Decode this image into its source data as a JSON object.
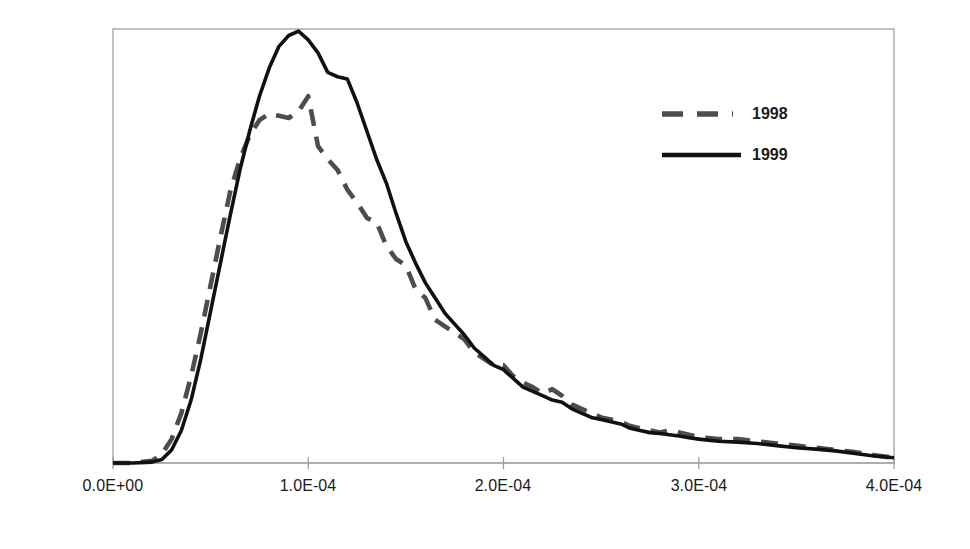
{
  "chart_data": {
    "type": "line",
    "title": "",
    "xlabel": "",
    "ylabel": "Likelihood",
    "xlim": [
      0.0,
      0.0004
    ],
    "ylim": [
      0,
      1.0
    ],
    "grid": false,
    "legend_position": "upper-right",
    "xticks": [
      "0.0E+00",
      "1.0E-04",
      "2.0E-04",
      "3.0E-04",
      "4.0E-04"
    ],
    "xtick_values": [
      0.0,
      0.0001,
      0.0002,
      0.0003,
      0.0004
    ],
    "yticks": [],
    "series": [
      {
        "name": "1998",
        "color": "#4d4d4d",
        "style": "dashed",
        "x": [
          0.0,
          1e-05,
          2e-05,
          2.5e-05,
          3e-05,
          3.5e-05,
          4e-05,
          4.5e-05,
          5e-05,
          5.5e-05,
          6e-05,
          6.5e-05,
          7e-05,
          7.5e-05,
          8e-05,
          8.5e-05,
          9e-05,
          9.5e-05,
          0.0001,
          0.000105,
          0.00011,
          0.000115,
          0.00012,
          0.000125,
          0.00013,
          0.000135,
          0.00014,
          0.000145,
          0.00015,
          0.000155,
          0.00016,
          0.000165,
          0.00017,
          0.000175,
          0.00018,
          0.000185,
          0.00019,
          0.000195,
          0.0002,
          0.000205,
          0.00021,
          0.000215,
          0.00022,
          0.000225,
          0.00023,
          0.000235,
          0.00024,
          0.000245,
          0.00025,
          0.000255,
          0.00026,
          0.000265,
          0.00027,
          0.000275,
          0.00028,
          0.000285,
          0.00029,
          0.000295,
          0.0003,
          0.00031,
          0.00032,
          0.00033,
          0.00034,
          0.00035,
          0.00036,
          0.00037,
          0.00038,
          0.00039,
          0.0004
        ],
        "y": [
          0.0,
          0.0,
          0.005,
          0.02,
          0.055,
          0.115,
          0.2,
          0.3,
          0.41,
          0.52,
          0.625,
          0.7,
          0.755,
          0.79,
          0.805,
          0.8,
          0.795,
          0.81,
          0.845,
          0.73,
          0.7,
          0.675,
          0.63,
          0.6,
          0.565,
          0.555,
          0.5,
          0.47,
          0.455,
          0.4,
          0.38,
          0.33,
          0.315,
          0.3,
          0.285,
          0.255,
          0.24,
          0.225,
          0.225,
          0.2,
          0.185,
          0.175,
          0.16,
          0.17,
          0.155,
          0.135,
          0.125,
          0.115,
          0.105,
          0.1,
          0.095,
          0.085,
          0.08,
          0.075,
          0.07,
          0.075,
          0.07,
          0.065,
          0.06,
          0.055,
          0.055,
          0.05,
          0.045,
          0.04,
          0.035,
          0.03,
          0.025,
          0.018,
          0.012
        ]
      },
      {
        "name": "1999",
        "color": "#111111",
        "style": "solid",
        "x": [
          0.0,
          1e-05,
          2e-05,
          2.5e-05,
          3e-05,
          3.5e-05,
          4e-05,
          4.5e-05,
          5e-05,
          5.5e-05,
          6e-05,
          6.5e-05,
          7e-05,
          7.5e-05,
          8e-05,
          8.5e-05,
          9e-05,
          9.5e-05,
          0.0001,
          0.000105,
          0.00011,
          0.000115,
          0.00012,
          0.000125,
          0.00013,
          0.000135,
          0.00014,
          0.000145,
          0.00015,
          0.000155,
          0.00016,
          0.000165,
          0.00017,
          0.000175,
          0.00018,
          0.000185,
          0.00019,
          0.000195,
          0.0002,
          0.000205,
          0.00021,
          0.000215,
          0.00022,
          0.000225,
          0.00023,
          0.000235,
          0.00024,
          0.000245,
          0.00025,
          0.000255,
          0.00026,
          0.000265,
          0.00027,
          0.000275,
          0.00028,
          0.000285,
          0.00029,
          0.000295,
          0.0003,
          0.00031,
          0.00032,
          0.00033,
          0.00034,
          0.00035,
          0.00036,
          0.00037,
          0.00038,
          0.00039,
          0.0004
        ],
        "y": [
          0.0,
          0.0,
          0.002,
          0.008,
          0.03,
          0.075,
          0.145,
          0.24,
          0.35,
          0.46,
          0.57,
          0.675,
          0.765,
          0.845,
          0.91,
          0.96,
          0.985,
          0.995,
          0.975,
          0.945,
          0.9,
          0.89,
          0.885,
          0.83,
          0.765,
          0.7,
          0.645,
          0.575,
          0.51,
          0.46,
          0.415,
          0.38,
          0.345,
          0.32,
          0.295,
          0.265,
          0.245,
          0.225,
          0.215,
          0.195,
          0.175,
          0.165,
          0.155,
          0.145,
          0.14,
          0.125,
          0.115,
          0.105,
          0.1,
          0.095,
          0.09,
          0.08,
          0.075,
          0.07,
          0.068,
          0.065,
          0.062,
          0.058,
          0.055,
          0.05,
          0.048,
          0.045,
          0.04,
          0.035,
          0.032,
          0.028,
          0.022,
          0.016,
          0.012
        ]
      }
    ]
  },
  "legend": {
    "items": [
      {
        "label": "1998"
      },
      {
        "label": "1999"
      }
    ]
  },
  "axes": {
    "ylabel": "Likelihood",
    "xtick_labels": [
      "0.0E+00",
      "1.0E-04",
      "2.0E-04",
      "3.0E-04",
      "4.0E-04"
    ]
  },
  "colors": {
    "series_1998": "#4d4d4d",
    "series_1999": "#111111",
    "axis": "#9a9a9a",
    "text": "#1a1a1a"
  }
}
